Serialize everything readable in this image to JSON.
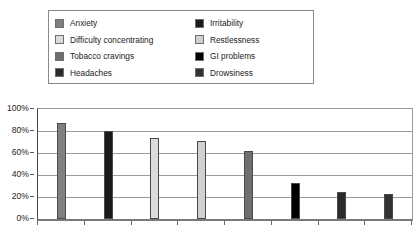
{
  "legend": {
    "items": [
      {
        "label": "Anxiety",
        "color": "#808080",
        "swatch_name": "legend-swatch-anxiety"
      },
      {
        "label": "Irritability",
        "color": "#1a1a1a",
        "swatch_name": "legend-swatch-irritability"
      },
      {
        "label": "Difficulty concentrating",
        "color": "#dcdcdc",
        "swatch_name": "legend-swatch-difficulty-concentrating"
      },
      {
        "label": "Restlessness",
        "color": "#d0d0d0",
        "swatch_name": "legend-swatch-restlessness"
      },
      {
        "label": "Tobacco cravings",
        "color": "#6e6e6e",
        "swatch_name": "legend-swatch-tobacco-cravings"
      },
      {
        "label": "GI problems",
        "color": "#000000",
        "swatch_name": "legend-swatch-gi-problems"
      },
      {
        "label": "Headaches",
        "color": "#2b2b2b",
        "swatch_name": "legend-swatch-headaches"
      },
      {
        "label": "Drowsiness",
        "color": "#333333",
        "swatch_name": "legend-swatch-drowsiness"
      }
    ]
  },
  "axis": {
    "y_ticks": [
      "100%",
      "80%",
      "60%",
      "40%",
      "20%",
      "0%"
    ]
  },
  "chart_data": {
    "type": "bar",
    "title": "",
    "xlabel": "",
    "ylabel": "",
    "ylim": [
      0,
      100
    ],
    "ytick_values": [
      0,
      20,
      40,
      60,
      80,
      100
    ],
    "ytick_labels": [
      "0%",
      "20%",
      "40%",
      "60%",
      "80%",
      "100%"
    ],
    "grid": true,
    "legend_position": "top",
    "xtick_labels": [],
    "categories": [
      "Anxiety",
      "Irritability",
      "Difficulty concentrating",
      "Restlessness",
      "Tobacco cravings",
      "GI problems",
      "Headaches",
      "Drowsiness"
    ],
    "values": [
      87,
      80,
      74,
      71,
      62,
      33,
      25,
      23
    ],
    "colors": [
      "#808080",
      "#1a1a1a",
      "#dcdcdc",
      "#d0d0d0",
      "#6e6e6e",
      "#000000",
      "#2b2b2b",
      "#333333"
    ]
  }
}
